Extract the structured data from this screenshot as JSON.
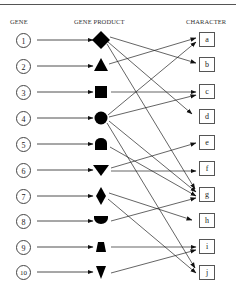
{
  "headers": {
    "gene": "GENE",
    "product": "GENE PRODUCT",
    "character": "CHARACTER"
  },
  "genes": [
    "1",
    "2",
    "3",
    "4",
    "5",
    "6",
    "7",
    "8",
    "9",
    "10"
  ],
  "products": [
    "diamond",
    "triangle-up",
    "square",
    "circle",
    "dome",
    "triangle-down",
    "small-diamond",
    "half-circle",
    "trapezoid",
    "small-triangle-down"
  ],
  "characters": [
    "a",
    "b",
    "c",
    "d",
    "e",
    "f",
    "g",
    "h",
    "i",
    "j"
  ],
  "connections": [
    {
      "from": "1",
      "to": "b"
    },
    {
      "from": "1",
      "to": "d"
    },
    {
      "from": "1",
      "to": "g"
    },
    {
      "from": "2",
      "to": "a"
    },
    {
      "from": "3",
      "to": "c"
    },
    {
      "from": "4",
      "to": "a"
    },
    {
      "from": "4",
      "to": "c"
    },
    {
      "from": "4",
      "to": "g"
    },
    {
      "from": "4",
      "to": "j"
    },
    {
      "from": "5",
      "to": "g"
    },
    {
      "from": "6",
      "to": "e"
    },
    {
      "from": "6",
      "to": "f"
    },
    {
      "from": "7",
      "to": "h"
    },
    {
      "from": "7",
      "to": "j"
    },
    {
      "from": "8",
      "to": "g"
    },
    {
      "from": "9",
      "to": "i"
    },
    {
      "from": "10",
      "to": "i"
    }
  ]
}
